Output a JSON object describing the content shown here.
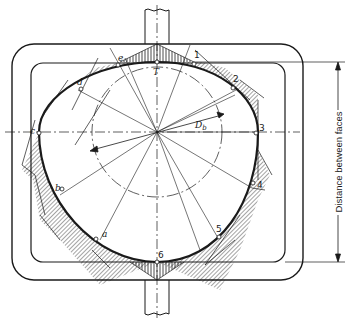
{
  "diagram": {
    "title": "",
    "points_numbered": [
      "1",
      "2",
      "3",
      "4",
      "5",
      "6"
    ],
    "points_lettered": [
      "a",
      "b",
      "c",
      "d",
      "e"
    ],
    "top_point_label": "T",
    "diameter_label": "D",
    "diameter_subscript": "b",
    "dimension_label": "Distance between faces",
    "colors": {
      "line": "#1a1a1a",
      "background": "#ffffff"
    }
  }
}
